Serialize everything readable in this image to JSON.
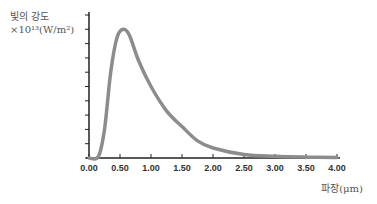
{
  "chart_data": {
    "type": "line",
    "title": "",
    "ylabel": "빛의 강도",
    "ylabel_unit": "×10¹³(W/m²)",
    "xlabel": "파장(μm)",
    "xlim": [
      0,
      4
    ],
    "ylim": [
      0,
      10
    ],
    "x_ticks": [
      "0.00",
      "0.50",
      "1.00",
      "1.50",
      "2.00",
      "2.50",
      "3.00",
      "3.50",
      "4.00"
    ],
    "y_tick_count": 10,
    "y_tick_labels_shown": false,
    "grid": false,
    "series": [
      {
        "name": "intensity",
        "color": "#8c8c8c",
        "x": [
          0.0,
          0.15,
          0.25,
          0.35,
          0.45,
          0.55,
          0.65,
          0.8,
          1.0,
          1.25,
          1.5,
          1.75,
          2.0,
          2.5,
          3.0,
          3.5,
          4.0
        ],
        "y": [
          0,
          0.1,
          2.0,
          6.0,
          8.4,
          9.0,
          8.6,
          6.8,
          5.0,
          3.3,
          2.2,
          1.2,
          0.7,
          0.25,
          0.12,
          0.06,
          0.03
        ]
      }
    ]
  }
}
